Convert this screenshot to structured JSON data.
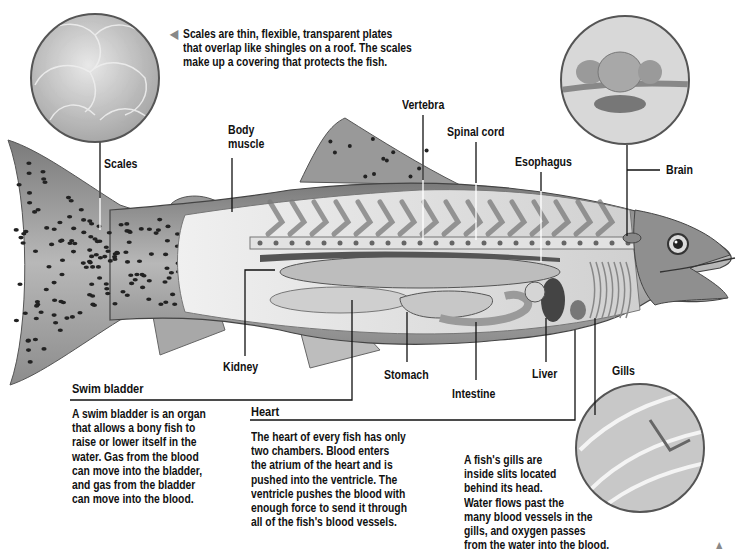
{
  "labels": {
    "scales": "Scales",
    "body_muscle": "Body\nmuscle",
    "vertebra": "Vertebra",
    "spinal_cord": "Spinal cord",
    "esophagus": "Esophagus",
    "brain": "Brain",
    "kidney": "Kidney",
    "stomach": "Stomach",
    "intestine": "Intestine",
    "liver": "Liver",
    "gills": "Gills"
  },
  "callouts": {
    "scales": {
      "text": "Scales are thin, flexible, transparent plates\nthat overlap like shingles on a roof. The scales\nmake up a covering that protects the fish.",
      "arrow_icon": "triangle-left-icon"
    },
    "swim_bladder": {
      "heading": "Swim bladder",
      "text": "A swim bladder is an organ\nthat allows a bony fish to\nraise or lower itself in the\nwater. Gas from the blood\ncan move into the bladder,\nand gas from the bladder\ncan move into the blood."
    },
    "heart": {
      "heading": "Heart",
      "text": "The heart of every fish has only\ntwo chambers. Blood enters\nthe atrium of the heart and is\npushed into the ventricle. The\nventricle pushes the blood with\nenough force to send it through\nall of the fish's blood vessels."
    },
    "gills": {
      "text": "A fish's gills are\ninside slits located\nbehind its head.\nWater flows past the\nmany blood vessels in the\ngills, and oxygen passes\nfrom the water into the blood.",
      "arrow_icon": "triangle-up-icon"
    }
  },
  "colors": {
    "fish_body": "#9a9a9a",
    "fish_light": "#d8d8d8",
    "spots": "#2a2a2a",
    "muscle": "#e6e6e6",
    "organ": "#b5b5b5",
    "line": "#111111"
  }
}
